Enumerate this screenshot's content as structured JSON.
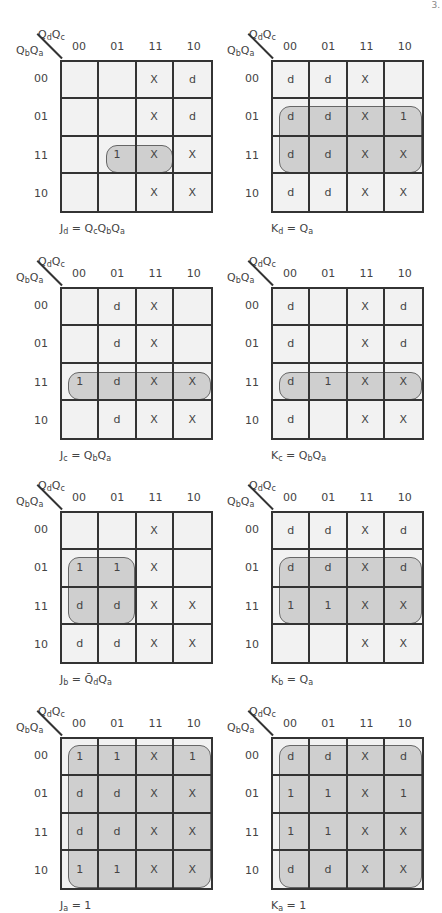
{
  "page": {
    "number": "3."
  },
  "axis": {
    "col_vars": "QdQc",
    "row_vars": "QbQa",
    "col_labels": [
      "00",
      "01",
      "11",
      "10"
    ],
    "row_labels": [
      "00",
      "01",
      "11",
      "10"
    ]
  },
  "kmaps": [
    {
      "id": "Jd",
      "expression": "Jd = QcQbQa",
      "cells": [
        [
          "",
          "",
          "X",
          "d"
        ],
        [
          "",
          "",
          "X",
          "d"
        ],
        [
          "",
          "1",
          "X",
          "X"
        ],
        [
          "",
          "",
          "X",
          "X"
        ]
      ],
      "groups": [
        {
          "row_start": 2,
          "row_end": 2,
          "col_start": 1,
          "col_end": 2
        }
      ]
    },
    {
      "id": "Kd",
      "expression": "Kd = Qa",
      "cells": [
        [
          "d",
          "d",
          "X",
          ""
        ],
        [
          "d",
          "d",
          "X",
          "1"
        ],
        [
          "d",
          "d",
          "X",
          "X"
        ],
        [
          "d",
          "d",
          "X",
          "X"
        ]
      ],
      "groups": [
        {
          "row_start": 1,
          "row_end": 2,
          "col_start": 0,
          "col_end": 3
        }
      ]
    },
    {
      "id": "Jc",
      "expression": "Jc = QbQa",
      "cells": [
        [
          "",
          "d",
          "X",
          ""
        ],
        [
          "",
          "d",
          "X",
          ""
        ],
        [
          "1",
          "d",
          "X",
          "X"
        ],
        [
          "",
          "d",
          "X",
          "X"
        ]
      ],
      "groups": [
        {
          "row_start": 2,
          "row_end": 2,
          "col_start": 0,
          "col_end": 3
        }
      ]
    },
    {
      "id": "Kc",
      "expression": "Kc = QbQa",
      "cells": [
        [
          "d",
          "",
          "X",
          "d"
        ],
        [
          "d",
          "",
          "X",
          "d"
        ],
        [
          "d",
          "1",
          "X",
          "X"
        ],
        [
          "d",
          "",
          "X",
          "X"
        ]
      ],
      "groups": [
        {
          "row_start": 2,
          "row_end": 2,
          "col_start": 0,
          "col_end": 3
        }
      ]
    },
    {
      "id": "Jb",
      "expression": "Jb = Q̄dQa",
      "cells": [
        [
          "",
          "",
          "X",
          ""
        ],
        [
          "1",
          "1",
          "X",
          ""
        ],
        [
          "d",
          "d",
          "X",
          "X"
        ],
        [
          "d",
          "d",
          "X",
          "X"
        ]
      ],
      "groups": [
        {
          "row_start": 1,
          "row_end": 2,
          "col_start": 0,
          "col_end": 1
        }
      ]
    },
    {
      "id": "Kb",
      "expression": "Kb = Qa",
      "cells": [
        [
          "d",
          "d",
          "X",
          "d"
        ],
        [
          "d",
          "d",
          "X",
          "d"
        ],
        [
          "1",
          "1",
          "X",
          "X"
        ],
        [
          "",
          "",
          "X",
          "X"
        ]
      ],
      "groups": [
        {
          "row_start": 1,
          "row_end": 2,
          "col_start": 0,
          "col_end": 3
        }
      ]
    },
    {
      "id": "Ja",
      "expression": "Ja = 1",
      "cells": [
        [
          "1",
          "1",
          "X",
          "1"
        ],
        [
          "d",
          "d",
          "X",
          "X"
        ],
        [
          "d",
          "d",
          "X",
          "X"
        ],
        [
          "1",
          "1",
          "X",
          "X"
        ]
      ],
      "groups": [
        {
          "row_start": 0,
          "row_end": 3,
          "col_start": 0,
          "col_end": 3
        }
      ]
    },
    {
      "id": "Ka",
      "expression": "Ka = 1",
      "cells": [
        [
          "d",
          "d",
          "X",
          "d"
        ],
        [
          "1",
          "1",
          "X",
          "1"
        ],
        [
          "1",
          "1",
          "X",
          "X"
        ],
        [
          "d",
          "d",
          "X",
          "X"
        ]
      ],
      "groups": [
        {
          "row_start": 0,
          "row_end": 3,
          "col_start": 0,
          "col_end": 3
        }
      ]
    }
  ],
  "colors": {
    "cell_bg": "#f2f2f2",
    "group_fill": "#c8c8c8",
    "grid_line": "#333333"
  }
}
